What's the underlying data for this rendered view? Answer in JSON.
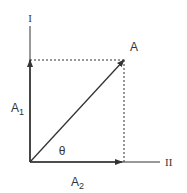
{
  "diagram": {
    "type": "vector-decomposition",
    "axes": {
      "vertical_label": "I",
      "horizontal_label": "II"
    },
    "vector": {
      "label": "A",
      "angle_label": "θ"
    },
    "components": {
      "vertical": {
        "label_main": "A",
        "label_sub": "1"
      },
      "horizontal": {
        "label_main": "A",
        "label_sub": "2"
      }
    },
    "colors": {
      "line": "#333333",
      "background": "#ffffff"
    }
  }
}
